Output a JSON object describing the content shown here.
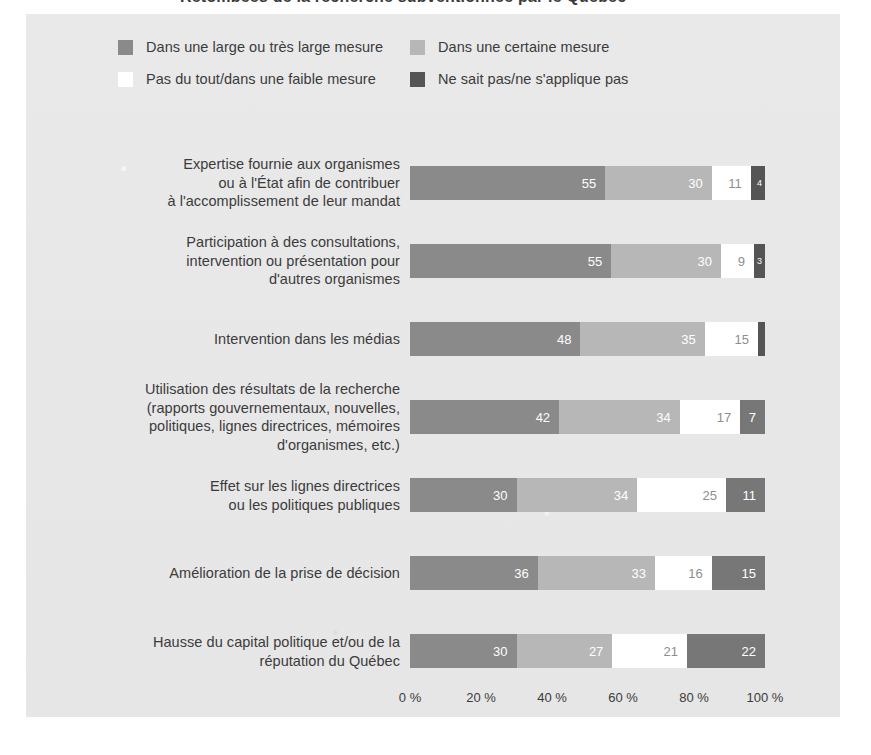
{
  "title_fragment": "Retombées de la recherche subventionnée par le Québec",
  "legend": {
    "items": [
      {
        "label": "Dans une large ou très large mesure",
        "color": "#8a8a8a",
        "key": "large"
      },
      {
        "label": "Dans une certaine mesure",
        "color": "#b7b7b7",
        "key": "certaine"
      },
      {
        "label": "Pas du tout/dans une faible mesure",
        "color": "#ffffff",
        "key": "faible"
      },
      {
        "label": "Ne sait pas/ne s'applique pas",
        "color": "#555555",
        "key": "nsp"
      }
    ]
  },
  "axis": {
    "ticks": [
      "0 %",
      "20 %",
      "40 %",
      "60 %",
      "80 %",
      "100 %"
    ],
    "tick_values": [
      0,
      20,
      40,
      60,
      80,
      100
    ],
    "min": 0,
    "max": 100
  },
  "chart_data": {
    "type": "bar",
    "orientation": "horizontal",
    "stacked": true,
    "stack_mode": "percent",
    "title": "Retombées de la recherche subventionnée par le Québec",
    "xlabel": "",
    "ylabel": "",
    "xlim": [
      0,
      100
    ],
    "xticks": [
      0,
      20,
      40,
      60,
      80,
      100
    ],
    "xticklabels": [
      "0 %",
      "20 %",
      "40 %",
      "60 %",
      "80 %",
      "100 %"
    ],
    "grid": false,
    "legend_position": "top-left",
    "categories": [
      "Expertise fournie aux organismes ou à l'État afin de contribuer à l'accomplissement de leur mandat",
      "Participation à des consultations, intervention ou présentation pour d'autres organismes",
      "Intervention dans les médias",
      "Utilisation des résultats de la recherche (rapports gouvernementaux, nouvelles, politiques, lignes directrices, mémoires d'organismes, etc.)",
      "Effet sur les lignes directrices ou les politiques publiques",
      "Amélioration de la prise de décision",
      "Hausse du capital politique et/ou de la réputation du Québec"
    ],
    "series": [
      {
        "name": "Dans une large ou très large mesure",
        "color": "#8a8a8a",
        "values": [
          55,
          55,
          48,
          42,
          30,
          36,
          30
        ]
      },
      {
        "name": "Dans une certaine mesure",
        "color": "#b7b7b7",
        "values": [
          30,
          30,
          35,
          34,
          34,
          33,
          27
        ]
      },
      {
        "name": "Pas du tout/dans une faible mesure",
        "color": "#ffffff",
        "values": [
          11,
          9,
          15,
          17,
          25,
          16,
          21
        ]
      },
      {
        "name": "Ne sait pas/ne s'applique pas",
        "color": "#555555",
        "values": [
          4,
          3,
          2,
          7,
          11,
          15,
          22
        ]
      }
    ]
  },
  "rows": [
    {
      "label_lines": [
        "Expertise fournie aux organismes",
        "ou à l'État afin de contribuer",
        "à l'accomplissement de leur mandat"
      ],
      "segments": [
        {
          "value": 55,
          "label": "55",
          "color": "#8a8a8a",
          "text": "on-dark",
          "size": "normal"
        },
        {
          "value": 30,
          "label": "30",
          "color": "#b7b7b7",
          "text": "on-dark",
          "size": "normal"
        },
        {
          "value": 11,
          "label": "11",
          "color": "#ffffff",
          "text": "on-light",
          "size": "normal"
        },
        {
          "value": 4,
          "label": "4",
          "color": "#555555",
          "text": "on-dark",
          "size": "tiny"
        }
      ]
    },
    {
      "label_lines": [
        "Participation à des consultations,",
        "intervention ou présentation pour",
        "d'autres organismes"
      ],
      "segments": [
        {
          "value": 55,
          "label": "55",
          "color": "#8a8a8a",
          "text": "on-dark",
          "size": "normal"
        },
        {
          "value": 30,
          "label": "30",
          "color": "#b7b7b7",
          "text": "on-dark",
          "size": "normal"
        },
        {
          "value": 9,
          "label": "9",
          "color": "#ffffff",
          "text": "on-light",
          "size": "normal"
        },
        {
          "value": 3,
          "label": "3",
          "color": "#555555",
          "text": "on-dark",
          "size": "tiny"
        }
      ]
    },
    {
      "label_lines": [
        "Intervention dans les médias"
      ],
      "segments": [
        {
          "value": 48,
          "label": "48",
          "color": "#8a8a8a",
          "text": "on-dark",
          "size": "normal"
        },
        {
          "value": 35,
          "label": "35",
          "color": "#b7b7b7",
          "text": "on-dark",
          "size": "normal"
        },
        {
          "value": 15,
          "label": "15",
          "color": "#ffffff",
          "text": "on-light",
          "size": "normal"
        },
        {
          "value": 2,
          "label": "",
          "color": "#555555",
          "text": "on-dark",
          "size": "hidden"
        }
      ]
    },
    {
      "label_lines": [
        "Utilisation des résultats de la recherche",
        "(rapports gouvernementaux, nouvelles,",
        "politiques, lignes directrices, mémoires",
        "d'organismes, etc.)"
      ],
      "segments": [
        {
          "value": 42,
          "label": "42",
          "color": "#8a8a8a",
          "text": "on-dark",
          "size": "normal"
        },
        {
          "value": 34,
          "label": "34",
          "color": "#b7b7b7",
          "text": "on-dark",
          "size": "normal"
        },
        {
          "value": 17,
          "label": "17",
          "color": "#ffffff",
          "text": "on-light",
          "size": "normal"
        },
        {
          "value": 7,
          "label": "7",
          "color": "#777777",
          "text": "on-dark",
          "size": "normal"
        }
      ]
    },
    {
      "label_lines": [
        "Effet sur les lignes directrices",
        "ou les politiques publiques"
      ],
      "segments": [
        {
          "value": 30,
          "label": "30",
          "color": "#8a8a8a",
          "text": "on-dark",
          "size": "normal"
        },
        {
          "value": 34,
          "label": "34",
          "color": "#b7b7b7",
          "text": "on-dark",
          "size": "normal"
        },
        {
          "value": 25,
          "label": "25",
          "color": "#ffffff",
          "text": "on-light",
          "size": "normal"
        },
        {
          "value": 11,
          "label": "11",
          "color": "#777777",
          "text": "on-dark",
          "size": "normal"
        }
      ]
    },
    {
      "label_lines": [
        "Amélioration de la prise de décision"
      ],
      "segments": [
        {
          "value": 36,
          "label": "36",
          "color": "#8a8a8a",
          "text": "on-dark",
          "size": "normal"
        },
        {
          "value": 33,
          "label": "33",
          "color": "#b7b7b7",
          "text": "on-dark",
          "size": "normal"
        },
        {
          "value": 16,
          "label": "16",
          "color": "#ffffff",
          "text": "on-light",
          "size": "normal"
        },
        {
          "value": 15,
          "label": "15",
          "color": "#777777",
          "text": "on-dark",
          "size": "normal"
        }
      ]
    },
    {
      "label_lines": [
        "Hausse du capital politique et/ou de la",
        "réputation du Québec"
      ],
      "segments": [
        {
          "value": 30,
          "label": "30",
          "color": "#8a8a8a",
          "text": "on-dark",
          "size": "normal"
        },
        {
          "value": 27,
          "label": "27",
          "color": "#b7b7b7",
          "text": "on-dark",
          "size": "normal"
        },
        {
          "value": 21,
          "label": "21",
          "color": "#ffffff",
          "text": "on-light",
          "size": "normal"
        },
        {
          "value": 22,
          "label": "22",
          "color": "#777777",
          "text": "on-dark",
          "size": "normal"
        }
      ]
    }
  ]
}
